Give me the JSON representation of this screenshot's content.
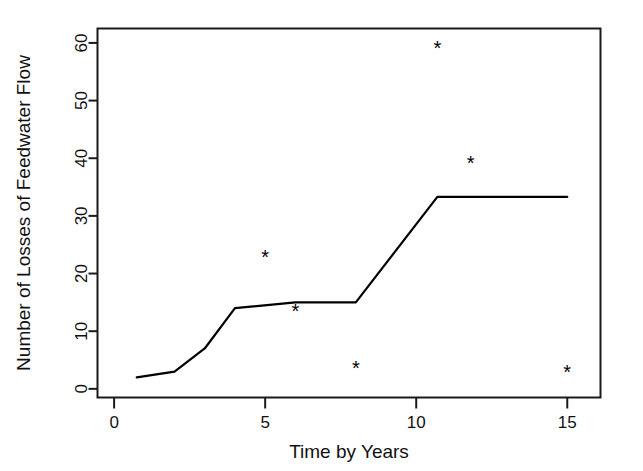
{
  "chart_data": {
    "type": "line",
    "title": "",
    "subtitle": "",
    "xlabel": "Time by Years",
    "ylabel": "Number of Losses of Feedwater Flow",
    "xlim": [
      -0.55,
      16.1
    ],
    "ylim": [
      -1.5,
      62.5
    ],
    "xticks": [
      0,
      5,
      10,
      15
    ],
    "xtick_labels": [
      "0",
      "5",
      "10",
      "15"
    ],
    "yticks": [
      0,
      10,
      20,
      30,
      40,
      50,
      60
    ],
    "ytick_labels": [
      "0",
      "10",
      "20",
      "30",
      "40",
      "50",
      "60"
    ],
    "grid": false,
    "legend": "none",
    "box": true,
    "series": [
      {
        "name": "fitted-step-line",
        "type": "line",
        "marker": "none",
        "color": "#000000",
        "x": [
          0.75,
          2.0,
          3.0,
          4.0,
          6.0,
          8.0,
          10.7,
          15.0
        ],
        "y": [
          2.0,
          3.0,
          7.0,
          14.0,
          15.0,
          15.0,
          33.3,
          33.3
        ]
      },
      {
        "name": "observed-points",
        "type": "scatter",
        "marker": "*",
        "color": "#000000",
        "x": [
          5.0,
          6.0,
          8.0,
          10.7,
          11.8,
          15.0
        ],
        "y": [
          22.7,
          13.3,
          3.5,
          59.0,
          39.0,
          2.7
        ]
      }
    ]
  },
  "axes": {
    "x_axis_title": "Time by Years",
    "y_axis_title": "Number of Losses of Feedwater Flow"
  }
}
